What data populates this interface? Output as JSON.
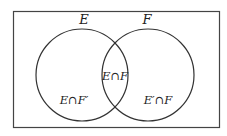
{
  "diagram": {
    "type": "venn",
    "sets": [
      {
        "id": "E",
        "label": "E"
      },
      {
        "id": "F",
        "label": "F"
      }
    ],
    "regions": {
      "e_only": "E∩F′",
      "both": "E∩F",
      "f_only": "E′∩F"
    },
    "colors": {
      "stroke": "#333333",
      "background": "#ffffff"
    }
  }
}
